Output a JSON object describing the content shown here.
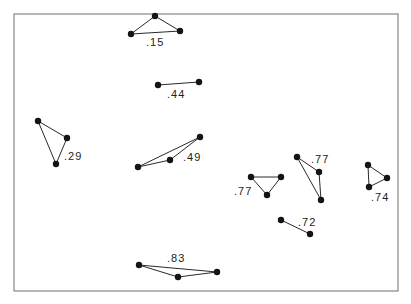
{
  "frame": {
    "x1": 14,
    "y1": 14,
    "x2": 398,
    "y2": 291,
    "stroke": "#6e6e6e"
  },
  "node_color": "#141414",
  "edge_color": "#2a2a2a",
  "node_radius": 3.2,
  "figures": [
    {
      "id": "fig-15",
      "label": ".15",
      "label_pos": [
        146,
        46
      ],
      "nodes": [
        [
          155,
          16
        ],
        [
          131,
          34
        ],
        [
          180,
          31
        ]
      ],
      "edges": [
        [
          0,
          1
        ],
        [
          0,
          2
        ],
        [
          1,
          2
        ]
      ]
    },
    {
      "id": "fig-44",
      "label": ".44",
      "label_pos": [
        167,
        98
      ],
      "nodes": [
        [
          158,
          85
        ],
        [
          199,
          82
        ]
      ],
      "edges": [
        [
          0,
          1
        ]
      ]
    },
    {
      "id": "fig-29",
      "label": ".29",
      "label_pos": [
        64,
        160
      ],
      "nodes": [
        [
          38,
          121
        ],
        [
          67,
          138
        ],
        [
          56,
          164
        ]
      ],
      "edges": [
        [
          0,
          1
        ],
        [
          1,
          2
        ],
        [
          2,
          0
        ]
      ]
    },
    {
      "id": "fig-49",
      "label": ".49",
      "label_pos": [
        183,
        161
      ],
      "nodes": [
        [
          138,
          167
        ],
        [
          170,
          160
        ],
        [
          200,
          137
        ]
      ],
      "edges": [
        [
          0,
          1
        ],
        [
          1,
          2
        ],
        [
          0,
          2
        ]
      ]
    },
    {
      "id": "fig-77a",
      "label": ".77",
      "label_pos": [
        234,
        195
      ],
      "nodes": [
        [
          251,
          177
        ],
        [
          281,
          177
        ],
        [
          267,
          195
        ]
      ],
      "edges": [
        [
          0,
          1
        ],
        [
          1,
          2
        ],
        [
          2,
          0
        ]
      ]
    },
    {
      "id": "fig-77b",
      "label": ".77",
      "label_pos": [
        311,
        163
      ],
      "nodes": [
        [
          297,
          157
        ],
        [
          319,
          172
        ],
        [
          321,
          200
        ]
      ],
      "edges": [
        [
          0,
          1
        ],
        [
          1,
          2
        ],
        [
          0,
          2
        ]
      ]
    },
    {
      "id": "fig-74",
      "label": ".74",
      "label_pos": [
        371,
        201
      ],
      "nodes": [
        [
          368,
          165
        ],
        [
          387,
          178
        ],
        [
          369,
          187
        ]
      ],
      "edges": [
        [
          0,
          1
        ],
        [
          1,
          2
        ],
        [
          2,
          0
        ]
      ]
    },
    {
      "id": "fig-72",
      "label": ".72",
      "label_pos": [
        298,
        226
      ],
      "nodes": [
        [
          281,
          220
        ],
        [
          310,
          234
        ]
      ],
      "edges": [
        [
          0,
          1
        ]
      ]
    },
    {
      "id": "fig-83",
      "label": ".83",
      "label_pos": [
        167,
        262
      ],
      "nodes": [
        [
          139,
          265
        ],
        [
          178,
          277
        ],
        [
          217,
          272
        ]
      ],
      "edges": [
        [
          0,
          1
        ],
        [
          1,
          2
        ],
        [
          0,
          2
        ]
      ]
    }
  ]
}
